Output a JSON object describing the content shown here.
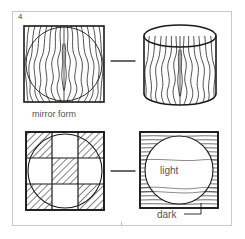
{
  "figure": {
    "number": "4",
    "frame_color": "#c9c9c9",
    "ink_color": "#1a1a1a",
    "text_color": "#555555",
    "background": "#ffffff"
  },
  "panels": {
    "top_left": {
      "name": "mirror-form-square",
      "shape": "square",
      "grain": "vertical wavy mirrored grain",
      "overlay": "inscribed circle",
      "caption": "mirror form"
    },
    "top_right": {
      "name": "mirror-form-cylinder",
      "shape": "cylinder",
      "grain": "vertical wavy mirrored grain wrapped on cylinder",
      "overlay": "top ellipse"
    },
    "bottom_left": {
      "name": "checkerboard-square",
      "shape": "square",
      "grain": "3x3 checkerboard of diagonally hatched cells",
      "overlay": "inscribed circle",
      "hatched_cells": [
        "top-left",
        "top-right",
        "center",
        "bottom-left",
        "bottom-right"
      ],
      "plain_cells": [
        "top-center",
        "middle-left",
        "middle-right",
        "bottom-center"
      ]
    },
    "bottom_right": {
      "name": "light-dark-square",
      "shape": "square",
      "grain": "horizontal grain, dense outside circle",
      "overlay": "inscribed circle",
      "labels": {
        "inside": "light",
        "outside": "dark"
      }
    }
  },
  "connectors": [
    {
      "name": "connector-top",
      "style": "horizontal dash"
    },
    {
      "name": "connector-bottom",
      "style": "horizontal dash"
    }
  ],
  "labels": {
    "mirror_form": "mirror form",
    "light": "light",
    "dark": "dark"
  }
}
